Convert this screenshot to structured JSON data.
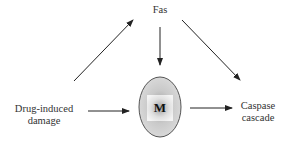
{
  "diagram": {
    "nodes": {
      "fas": {
        "label": "Fas"
      },
      "drug": {
        "line1": "Drug-induced",
        "line2": "damage"
      },
      "mito": {
        "label": "M"
      },
      "caspase": {
        "line1": "Caspase",
        "line2": "cascade"
      }
    },
    "edges": [
      {
        "from": "Drug-induced damage",
        "to": "Fas"
      },
      {
        "from": "Fas",
        "to": "M"
      },
      {
        "from": "Fas",
        "to": "Caspase cascade"
      },
      {
        "from": "Drug-induced damage",
        "to": "M"
      },
      {
        "from": "M",
        "to": "Caspase cascade"
      }
    ]
  }
}
